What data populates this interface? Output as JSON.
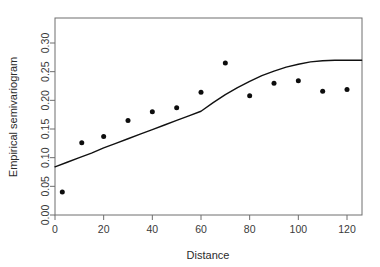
{
  "chart_data": {
    "type": "scatter",
    "title": "",
    "xlabel": "Distance",
    "ylabel": "Empirical semivariogram",
    "xlim": [
      0,
      126
    ],
    "ylim": [
      0,
      0.325
    ],
    "grid": false,
    "legend": "none",
    "xticks": [
      0,
      20,
      40,
      60,
      80,
      100,
      120
    ],
    "xtick_labels": [
      "0",
      "20",
      "40",
      "60",
      "80",
      "100",
      "120"
    ],
    "yticks": [
      0.0,
      0.05,
      0.1,
      0.15,
      0.2,
      0.25,
      0.3
    ],
    "ytick_labels": [
      "0.00",
      "0.05",
      "0.10",
      "0.15",
      "0.20",
      "0.25",
      "0.30"
    ],
    "series": [
      {
        "name": "Empirical semivariogram points",
        "type": "scatter",
        "marker": "filled-circle",
        "color": "#0d0d0d",
        "x": [
          3,
          11,
          20,
          30,
          40,
          50,
          60,
          70,
          80,
          90,
          100,
          110,
          120
        ],
        "y": [
          0.04,
          0.126,
          0.137,
          0.165,
          0.18,
          0.187,
          0.214,
          0.265,
          0.208,
          0.23,
          0.234,
          0.216,
          0.219
        ]
      },
      {
        "name": "Fitted variogram model",
        "type": "line",
        "color": "#111111",
        "x": [
          0,
          5,
          10,
          15,
          20,
          25,
          30,
          35,
          40,
          45,
          50,
          55,
          60,
          65,
          70,
          75,
          80,
          85,
          90,
          95,
          100,
          105,
          110,
          115,
          120,
          126
        ],
        "y": [
          0.084,
          0.092,
          0.1,
          0.108,
          0.117,
          0.125,
          0.133,
          0.141,
          0.149,
          0.157,
          0.165,
          0.173,
          0.181,
          0.196,
          0.21,
          0.222,
          0.233,
          0.243,
          0.251,
          0.258,
          0.263,
          0.267,
          0.269,
          0.27,
          0.27,
          0.27
        ]
      }
    ]
  },
  "axis": {
    "x_title": "Distance",
    "y_title": "Empirical semivariogram"
  }
}
